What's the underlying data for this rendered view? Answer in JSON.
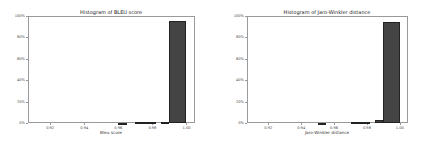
{
  "chart_data": [
    {
      "type": "bar",
      "title": "Histogram of BLEU score",
      "xlabel": "Bleu score",
      "ylabel": "",
      "xlim": [
        0.907,
        1.005
      ],
      "ylim": [
        0,
        100
      ],
      "x_ticks": [
        "0.92",
        "0.94",
        "0.96",
        "0.98",
        "1.00"
      ],
      "y_ticks": [
        "0%",
        "20%",
        "40%",
        "60%",
        "80%",
        "100%"
      ],
      "grid": false,
      "bins": [
        {
          "x0": 0.96,
          "x1": 0.965,
          "value": 0.3
        },
        {
          "x0": 0.97,
          "x1": 0.982,
          "value": 1.0
        },
        {
          "x0": 0.985,
          "x1": 0.99,
          "value": 1.0
        },
        {
          "x0": 0.99,
          "x1": 1.0,
          "value": 95.0
        }
      ]
    },
    {
      "type": "bar",
      "title": "Histogram of Jaro-Winkler distance",
      "xlabel": "Jaro-Winkler distance",
      "ylabel": "",
      "xlim": [
        0.907,
        1.005
      ],
      "ylim": [
        0,
        100
      ],
      "x_ticks": [
        "0.92",
        "0.94",
        "0.96",
        "0.98",
        "1.00"
      ],
      "y_ticks": [
        "0%",
        "20%",
        "40%",
        "60%",
        "80%",
        "100%"
      ],
      "grid": false,
      "bins": [
        {
          "x0": 0.95,
          "x1": 0.955,
          "value": 0.3
        },
        {
          "x0": 0.97,
          "x1": 0.982,
          "value": 0.8
        },
        {
          "x0": 0.985,
          "x1": 0.99,
          "value": 2.5
        },
        {
          "x0": 0.99,
          "x1": 1.0,
          "value": 94.0
        }
      ]
    }
  ],
  "charts": {
    "left": {
      "title": "Histogram of BLEU score",
      "xlabel": "Bleu score"
    },
    "right": {
      "title": "Histogram of Jaro-Winkler distance",
      "xlabel": "Jaro-Winkler distance"
    }
  }
}
